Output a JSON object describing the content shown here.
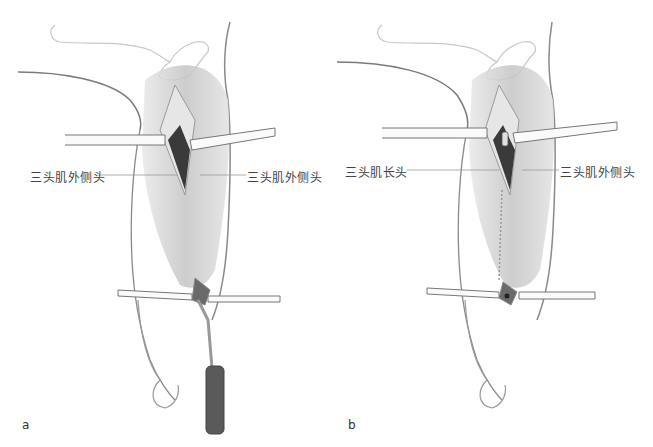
{
  "figure": {
    "panels": [
      {
        "id": "a",
        "letter": "a",
        "labels": {
          "left": "三头肌外侧头",
          "right": "三头肌外侧头"
        },
        "instruments": [
          "upper-retractors",
          "lower-retractors",
          "elevator-with-dark-handle"
        ]
      },
      {
        "id": "b",
        "letter": "b",
        "labels": {
          "left": "三头肌长头",
          "right": "三头肌外侧头"
        },
        "instruments": [
          "upper-retractors",
          "lower-retractors"
        ]
      }
    ],
    "colors": {
      "outline": "#8a8a8a",
      "muscle": "#c8c8c8",
      "deep": "#3a3a3a",
      "handle": "#5a5a5a",
      "leader_line": "#999999",
      "text": "#444444"
    }
  }
}
